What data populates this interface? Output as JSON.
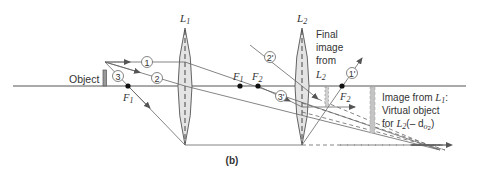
{
  "figure": {
    "panel_label": "(b)",
    "object_label": "Object",
    "lens1_label": "L",
    "lens1_sub": "1",
    "lens2_label": "L",
    "lens2_sub": "2",
    "focal_points": [
      {
        "label": "F",
        "sub": "1",
        "side": "left of L1"
      },
      {
        "label": "F",
        "sub": "1",
        "side": "right of L1"
      },
      {
        "label": "F",
        "sub": "2",
        "side": "left of L2"
      },
      {
        "label": "F",
        "sub": "2",
        "side": "right of L2"
      }
    ],
    "rays_lens1": [
      "1",
      "2",
      "3"
    ],
    "rays_lens2": [
      "1'",
      "2'",
      "3'"
    ],
    "final_image_text": [
      "Final",
      "image",
      "from"
    ],
    "final_image_lens": "L",
    "final_image_lens_sub": "2",
    "virtual_object_text_line1": "Image from ",
    "virtual_object_lens1": "L",
    "virtual_object_lens1_sub": "1",
    "virtual_object_text_line2": "Virtual object",
    "virtual_object_text_line3_prefix": "for ",
    "virtual_object_lens2": "L",
    "virtual_object_lens2_sub": "2",
    "virtual_object_distance": "(– d",
    "virtual_object_distance_sub": "o",
    "virtual_object_distance_sub2": "2",
    "virtual_object_distance_close": ")"
  },
  "colors": {
    "line": "#555555",
    "lens_fill": "#e4e4e4",
    "image_bar": "#b8b8b8",
    "text": "#333333"
  }
}
